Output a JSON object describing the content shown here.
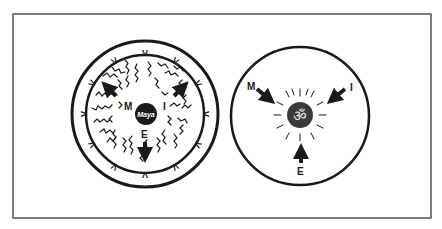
{
  "colors": {
    "ink": "#1a1a1a",
    "frame": "#555555",
    "om_disc": "#3a3a3a",
    "om_glyph": "#e8e8e8",
    "background": "#ffffff"
  },
  "left_figure": {
    "center_label": "Maya",
    "labels": {
      "m": "M",
      "i": "I",
      "e": "E"
    },
    "ring_marks": [
      "V",
      "V",
      "V",
      "V",
      "V",
      "V",
      "V",
      "V",
      "V",
      "V",
      "V",
      "V"
    ]
  },
  "right_figure": {
    "center_symbol": "ॐ",
    "center_icon": "om-sun-icon",
    "labels": {
      "m": "M",
      "i": "I",
      "e": "E"
    }
  }
}
